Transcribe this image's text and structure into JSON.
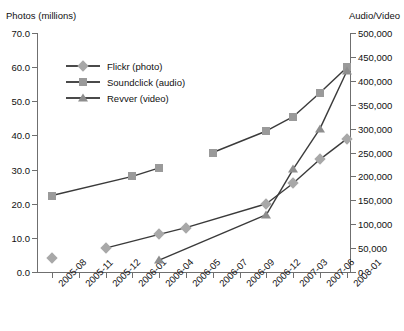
{
  "chart_data": {
    "type": "line",
    "title": "",
    "left_axis_title": "Photos (millions)",
    "right_axis_title": "Audio/Video",
    "xlabel": "",
    "grid": false,
    "legend_position": "top-left-inside",
    "categories": [
      "2005-08",
      "2005-11",
      "2005-12",
      "2006-01",
      "2006-04",
      "2006-05",
      "2006-07",
      "2006-09",
      "2006-12",
      "2007-03",
      "2007-06",
      "2008-01"
    ],
    "left_ylim": [
      0,
      70
    ],
    "left_ticks": [
      "0.0",
      "10.0",
      "20.0",
      "30.0",
      "40.0",
      "50.0",
      "60.0",
      "70.0"
    ],
    "right_ylim": [
      0,
      500000
    ],
    "right_ticks": [
      "0",
      "50,000",
      "100,000",
      "150,000",
      "200,000",
      "250,000",
      "300,000",
      "350,000",
      "400,000",
      "450,000",
      "500,000"
    ],
    "series": [
      {
        "name": "Flickr (photo)",
        "legend_label": "Flickr (photo)",
        "axis": "left",
        "marker": "diamond",
        "color": "#a8a8a8",
        "line_color": "#3a3a3a",
        "points": [
          {
            "x": "2005-08",
            "y": 4.0,
            "connected": false
          },
          {
            "x": "2005-12",
            "y": 7.0,
            "connected": false
          },
          {
            "x": "2006-04",
            "y": 11.0,
            "connected": true
          },
          {
            "x": "2006-05",
            "y": 13.0,
            "connected": true
          },
          {
            "x": "2006-12",
            "y": 20.0,
            "connected": true
          },
          {
            "x": "2007-03",
            "y": 26.0,
            "connected": true
          },
          {
            "x": "2007-06",
            "y": 33.0,
            "connected": true
          },
          {
            "x": "2008-01",
            "y": 39.0,
            "connected": true
          }
        ]
      },
      {
        "name": "Soundclick (audio)",
        "legend_label": "Soundclick (audio)",
        "axis": "right",
        "marker": "square",
        "color": "#9a9a9a",
        "line_color": "#3a3a3a",
        "points": [
          {
            "x": "2005-08",
            "y": 160000,
            "connected": false
          },
          {
            "x": "2006-01",
            "y": 200000,
            "connected": true
          },
          {
            "x": "2006-04",
            "y": 218000,
            "connected": true
          },
          {
            "x": "2006-07",
            "y": 250000,
            "connected": false
          },
          {
            "x": "2006-12",
            "y": 295000,
            "connected": true
          },
          {
            "x": "2007-03",
            "y": 325000,
            "connected": true
          },
          {
            "x": "2007-06",
            "y": 375000,
            "connected": true
          },
          {
            "x": "2008-01",
            "y": 428000,
            "connected": true
          }
        ]
      },
      {
        "name": "Revver (video)",
        "legend_label": "Revver (video)",
        "axis": "right",
        "marker": "triangle",
        "color": "#8e8e8e",
        "line_color": "#3a3a3a",
        "points": [
          {
            "x": "2006-04",
            "y": 25000,
            "connected": false
          },
          {
            "x": "2006-12",
            "y": 120000,
            "connected": true
          },
          {
            "x": "2007-03",
            "y": 215000,
            "connected": true
          },
          {
            "x": "2007-06",
            "y": 300000,
            "connected": true
          },
          {
            "x": "2008-01",
            "y": 420000,
            "connected": true
          }
        ]
      }
    ]
  },
  "colors": {
    "axis": "#6f6f6f",
    "text": "#111111",
    "line": "#3a3a3a",
    "background": "#ffffff"
  }
}
